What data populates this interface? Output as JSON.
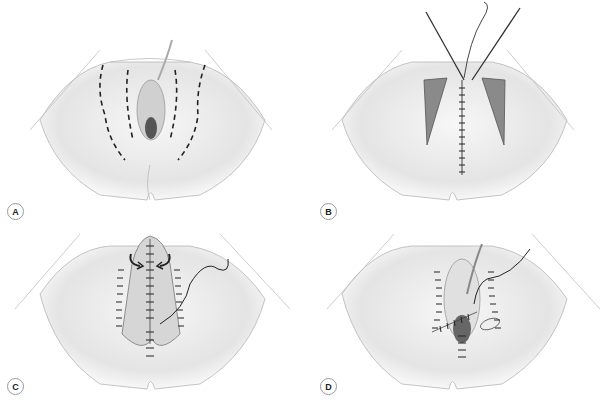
{
  "figure": {
    "panels": [
      {
        "label": "A",
        "description": "dashed incision lines on perineum"
      },
      {
        "label": "B",
        "description": "lateral flaps with midline sutures and needle holders"
      },
      {
        "label": "C",
        "description": "mobilized flap rotated to midline with sutures and arrows"
      },
      {
        "label": "D",
        "description": "closed wound with sutures and thread"
      }
    ],
    "colors": {
      "background": "#ffffff",
      "skin": "#ebebeb",
      "outline": "#9a9a9a",
      "suture": "#333333",
      "flap": "#d8d8d8"
    }
  }
}
